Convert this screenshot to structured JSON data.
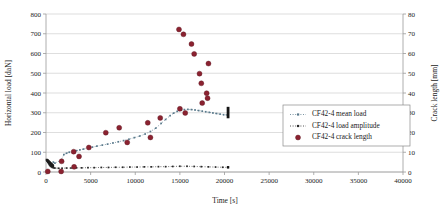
{
  "chart_data": {
    "type": "scatter",
    "title": "",
    "xlabel": "Time [s]",
    "ylabel": "Horizontal load  [daN]",
    "y2label": "Crack length [mm]",
    "xlim": [
      0,
      40000
    ],
    "ylim": [
      0,
      800
    ],
    "y2lim": [
      0,
      80
    ],
    "xticks": [
      0,
      5000,
      10000,
      15000,
      20000,
      25000,
      30000,
      35000,
      40000
    ],
    "xtick_labels": [
      "0",
      "5000",
      "10000",
      "15000",
      "20000",
      "25000",
      "30000",
      "35000",
      "40000"
    ],
    "yticks": [
      0,
      100,
      200,
      300,
      400,
      500,
      600,
      700,
      800
    ],
    "ytick_labels": [
      "0",
      "100",
      "200",
      "300",
      "400",
      "500",
      "600",
      "700",
      "800"
    ],
    "y2ticks": [
      0,
      10,
      20,
      30,
      40,
      50,
      60,
      70,
      80
    ],
    "y2tick_labels": [
      "0",
      "10",
      "20",
      "30",
      "40",
      "50",
      "60",
      "70",
      "80"
    ],
    "grid": true,
    "grid_axis": "y",
    "legend_position": "right",
    "colors": {
      "mean_load": "#5a7a8c",
      "load_amplitude": "#2b2b2b",
      "crack_length": "#8b2230",
      "grid": "#c8c8c8",
      "axis": "#9a9a9a",
      "text": "#1a1a1a"
    },
    "series": [
      {
        "name": "CF42-4 mean load",
        "axis": "left",
        "marker": "small-square",
        "line": "dotted",
        "color": "#5a7a8c",
        "points": [
          [
            120,
            60
          ],
          [
            180,
            55
          ],
          [
            240,
            50
          ],
          [
            300,
            46
          ],
          [
            360,
            42
          ],
          [
            420,
            38
          ],
          [
            480,
            35
          ],
          [
            560,
            32
          ],
          [
            640,
            30
          ],
          [
            720,
            28
          ],
          [
            820,
            50
          ],
          [
            1000,
            45
          ],
          [
            1700,
            60
          ],
          [
            2000,
            88
          ],
          [
            2300,
            95
          ],
          [
            2600,
            100
          ],
          [
            3000,
            103
          ],
          [
            3400,
            108
          ],
          [
            3800,
            112
          ],
          [
            4200,
            116
          ],
          [
            4700,
            122
          ],
          [
            5200,
            126
          ],
          [
            5700,
            131
          ],
          [
            6300,
            136
          ],
          [
            6900,
            141
          ],
          [
            7500,
            147
          ],
          [
            8100,
            153
          ],
          [
            8700,
            159
          ],
          [
            9300,
            166
          ],
          [
            9900,
            174
          ],
          [
            10500,
            182
          ],
          [
            11100,
            192
          ],
          [
            11700,
            205
          ],
          [
            12300,
            222
          ],
          [
            12900,
            246
          ],
          [
            13400,
            266
          ],
          [
            13900,
            285
          ],
          [
            14300,
            298
          ],
          [
            14700,
            307
          ],
          [
            15100,
            313
          ],
          [
            15500,
            316
          ],
          [
            15900,
            317
          ],
          [
            16300,
            316
          ],
          [
            16700,
            314
          ],
          [
            17100,
            311
          ],
          [
            17500,
            308
          ],
          [
            17900,
            305
          ],
          [
            18300,
            302
          ],
          [
            18700,
            299
          ],
          [
            19100,
            296
          ],
          [
            19500,
            293
          ],
          [
            19900,
            290
          ],
          [
            20300,
            289
          ]
        ]
      },
      {
        "name": "CF42-4 load amplitude",
        "axis": "left",
        "marker": "small-square",
        "line": "dotted",
        "color": "#2b2b2b",
        "points": [
          [
            120,
            58
          ],
          [
            200,
            50
          ],
          [
            280,
            44
          ],
          [
            360,
            38
          ],
          [
            440,
            33
          ],
          [
            520,
            29
          ],
          [
            620,
            26
          ],
          [
            720,
            23
          ],
          [
            850,
            21
          ],
          [
            1000,
            20
          ],
          [
            1400,
            19
          ],
          [
            1800,
            19
          ],
          [
            2300,
            20
          ],
          [
            2800,
            20
          ],
          [
            3400,
            21
          ],
          [
            4000,
            21
          ],
          [
            4700,
            22
          ],
          [
            5400,
            22
          ],
          [
            6200,
            23
          ],
          [
            7000,
            23
          ],
          [
            7800,
            24
          ],
          [
            8600,
            24
          ],
          [
            9400,
            25
          ],
          [
            10200,
            25
          ],
          [
            11000,
            26
          ],
          [
            11800,
            26
          ],
          [
            12600,
            27
          ],
          [
            13400,
            27
          ],
          [
            14200,
            28
          ],
          [
            15000,
            29
          ],
          [
            15800,
            29
          ],
          [
            16600,
            28
          ],
          [
            17400,
            27
          ],
          [
            18200,
            26
          ],
          [
            19000,
            25
          ],
          [
            19800,
            24
          ],
          [
            20400,
            23
          ]
        ]
      },
      {
        "name": "CF42-4 crack length",
        "axis": "right",
        "marker": "circle",
        "line": "none",
        "color": "#8b2230",
        "points": [
          [
            200,
            0.3
          ],
          [
            1700,
            0.3
          ],
          [
            1750,
            5.4
          ],
          [
            3100,
            10.3
          ],
          [
            3150,
            2.6
          ],
          [
            3700,
            7.9
          ],
          [
            4800,
            12.4
          ],
          [
            6700,
            19.9
          ],
          [
            8200,
            22.4
          ],
          [
            9100,
            15.0
          ],
          [
            11400,
            24.9
          ],
          [
            11700,
            17.5
          ],
          [
            12800,
            27.4
          ],
          [
            14900,
            72.2
          ],
          [
            15000,
            32.0
          ],
          [
            15400,
            69.7
          ],
          [
            15600,
            29.9
          ],
          [
            16300,
            64.8
          ],
          [
            16600,
            59.8
          ],
          [
            17200,
            49.8
          ],
          [
            17400,
            44.9
          ],
          [
            17500,
            34.9
          ],
          [
            18000,
            39.9
          ],
          [
            18100,
            37.4
          ],
          [
            18200,
            54.9
          ]
        ]
      }
    ],
    "markers_special": {
      "start_cluster_note": "dense dark cluster of mean-load markers near t=0",
      "end_bar_note": "dark vertical marker bar at end of mean load series near t=20400"
    }
  },
  "legend": {
    "items": [
      {
        "label": "CF42-4 mean load",
        "marker": "dotted-line-square",
        "color": "#5a7a8c"
      },
      {
        "label": "CF42-4 load amplitude",
        "marker": "dotted-line-square",
        "color": "#2b2b2b"
      },
      {
        "label": "CF42-4 crack length",
        "marker": "filled-circle",
        "color": "#8b2230"
      }
    ]
  }
}
